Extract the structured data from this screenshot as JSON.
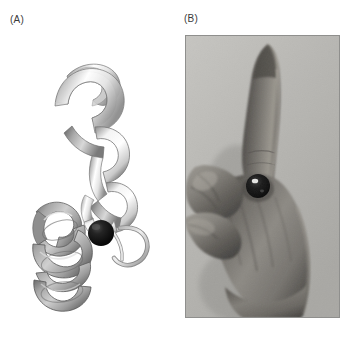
{
  "figure": {
    "type": "two-panel scientific figure",
    "background_color": "#ffffff",
    "width": 359,
    "height": 341
  },
  "panels": {
    "a": {
      "label": "(A)",
      "content": "ribbon diagram of a helix-loop-helix (EF-hand) protein motif with a bound metal ion",
      "ribbon_color_light": "#fbfbfb",
      "ribbon_color_shade": "#9a9a9a",
      "ribbon_outline": "#6f6f6f",
      "metal_ion": {
        "name": "metal-ion-sphere",
        "color": "#0d0d0d",
        "center_x": 101,
        "center_y": 233,
        "radius": 13
      },
      "elements": [
        "upper-helix-ribbon",
        "lower-helix-ribbon",
        "connecting-loop",
        "coil-tail",
        "metal-ion-sphere"
      ]
    },
    "b": {
      "label": "(B)",
      "content": "black and white photograph of a right hand in the EF-hand mnemonic pose holding a dark bead",
      "border_color": "#8f8f8d",
      "background_tone": "#b9b9b6",
      "skin_mid_tone": "#8e8c87",
      "skin_dark_tone": "#4f4d49",
      "skin_light_tone": "#c2c0ba",
      "bead": {
        "name": "bead",
        "color": "#101010",
        "center_x": 258,
        "center_y": 186,
        "radius": 12,
        "highlight_color": "#f2f2f2"
      },
      "elements": [
        "index-finger-extended",
        "thumb-extended",
        "folded-fingers",
        "back-of-hand",
        "wrist",
        "bead"
      ]
    }
  },
  "colors": {
    "page_background": "#ffffff",
    "label_text": "#3a3a3a",
    "ion_black": "#0d0d0d"
  }
}
